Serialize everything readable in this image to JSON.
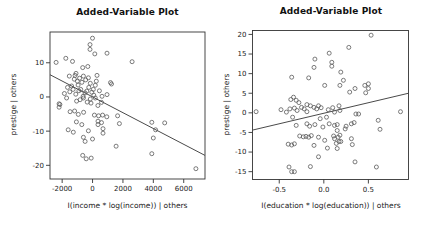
{
  "page": {
    "background": "#ffffff"
  },
  "chart_data": [
    {
      "type": "scatter",
      "title": "Added-Variable Plot",
      "xlabel": "I(income * log(income)) | others",
      "ylabel": "prestige | others",
      "xlim": [
        -2800,
        7400
      ],
      "ylim": [
        -24,
        19
      ],
      "xticks": [
        -2000,
        0,
        2000,
        4000,
        6000
      ],
      "xtick_labels": [
        "-2000",
        "0",
        "2000",
        "4000",
        "6000"
      ],
      "yticks": [
        -20,
        -10,
        0,
        10
      ],
      "ytick_labels": [
        "-20",
        "-10",
        "0",
        "10"
      ],
      "grid": false,
      "marker": "open-circle",
      "point_color": "#5a5a5a",
      "line_color": "#4a4a4a",
      "regression_line": {
        "x1": -2800,
        "y1": 6.5,
        "x2": 7400,
        "y2": -17.1
      },
      "points": [
        [
          0,
          17.2
        ],
        [
          -170,
          15.3
        ],
        [
          -170,
          13.9
        ],
        [
          150,
          12.6
        ],
        [
          950,
          12.8
        ],
        [
          2600,
          10.3
        ],
        [
          -2400,
          10.1
        ],
        [
          -1760,
          11.3
        ],
        [
          -1320,
          10.4
        ],
        [
          -650,
          8.6
        ],
        [
          -310,
          8.9
        ],
        [
          -1090,
          6.9
        ],
        [
          -1150,
          6.3
        ],
        [
          -600,
          6.1
        ],
        [
          -270,
          5.6
        ],
        [
          290,
          6.3
        ],
        [
          -1530,
          6.1
        ],
        [
          -1200,
          5.2
        ],
        [
          -850,
          5.5
        ],
        [
          -450,
          5.0
        ],
        [
          250,
          4.6
        ],
        [
          -1000,
          4.6
        ],
        [
          -700,
          4.3
        ],
        [
          -150,
          4.0
        ],
        [
          180,
          3.4
        ],
        [
          1180,
          4.2
        ],
        [
          1250,
          3.8
        ],
        [
          -950,
          3.5
        ],
        [
          -1380,
          3.2
        ],
        [
          -1650,
          2.8
        ],
        [
          -250,
          2.8
        ],
        [
          -2200,
          -2.0
        ],
        [
          -2200,
          -3.0
        ],
        [
          -2150,
          -2.2
        ],
        [
          -1850,
          1.0
        ],
        [
          -1710,
          -0.3
        ],
        [
          -1500,
          1.5
        ],
        [
          -1280,
          2.2
        ],
        [
          -1100,
          0.8
        ],
        [
          -900,
          1.8
        ],
        [
          -780,
          2.2
        ],
        [
          -620,
          0.2
        ],
        [
          -500,
          1.2
        ],
        [
          -380,
          1.7
        ],
        [
          -150,
          -0.6
        ],
        [
          -50,
          1.4
        ],
        [
          50,
          2.2
        ],
        [
          80,
          0.5
        ],
        [
          180,
          -0.3
        ],
        [
          450,
          1.8
        ],
        [
          620,
          0.2
        ],
        [
          950,
          0.7
        ],
        [
          -1050,
          -1.2
        ],
        [
          -820,
          -0.8
        ],
        [
          -600,
          -0.3
        ],
        [
          -350,
          -1.5
        ],
        [
          -100,
          -1.8
        ],
        [
          350,
          -2.5
        ],
        [
          590,
          -1.6
        ],
        [
          -1480,
          -4.3
        ],
        [
          -1180,
          -4.1
        ],
        [
          -940,
          -5.1
        ],
        [
          -590,
          -4.5
        ],
        [
          120,
          -5.3
        ],
        [
          400,
          -5.5
        ],
        [
          660,
          -5.3
        ],
        [
          940,
          -5.8
        ],
        [
          1650,
          -5.5
        ],
        [
          -1600,
          -9.6
        ],
        [
          -1270,
          -10.3
        ],
        [
          -1060,
          -7.3
        ],
        [
          -710,
          -8.1
        ],
        [
          360,
          -7.1
        ],
        [
          590,
          -7.5
        ],
        [
          360,
          -8.1
        ],
        [
          1770,
          -7.8
        ],
        [
          -270,
          -9.9
        ],
        [
          690,
          -9.3
        ],
        [
          690,
          -10.6
        ],
        [
          -600,
          -11.8
        ],
        [
          -490,
          -13.0
        ],
        [
          0,
          -12.3
        ],
        [
          -650,
          -17.1
        ],
        [
          -420,
          -18.1
        ],
        [
          -90,
          -17.9
        ],
        [
          1550,
          -14.4
        ],
        [
          3900,
          -7.4
        ],
        [
          4750,
          -7.6
        ],
        [
          4150,
          -9.6
        ],
        [
          4000,
          -12.0
        ],
        [
          3900,
          -16.6
        ],
        [
          6800,
          -21.0
        ]
      ]
    },
    {
      "type": "scatter",
      "title": "Added-Variable Plot",
      "xlabel": "I(education * log(education)) | others",
      "ylabel": "prestige | others",
      "xlim": [
        -0.8,
        0.95
      ],
      "ylim": [
        -17,
        21
      ],
      "xticks": [
        -0.5,
        0.0,
        0.5
      ],
      "xtick_labels": [
        "-0.5",
        "0.0",
        "0.5"
      ],
      "yticks": [
        -15,
        -10,
        -5,
        0,
        5,
        10,
        15,
        20
      ],
      "ytick_labels": [
        "-15",
        "-10",
        "-5",
        "0",
        "5",
        "10",
        "15",
        "20"
      ],
      "grid": false,
      "marker": "open-circle",
      "point_color": "#5a5a5a",
      "line_color": "#4a4a4a",
      "regression_line": {
        "x1": -0.8,
        "y1": -4.4,
        "x2": 0.95,
        "y2": 5.0
      },
      "points": [
        [
          -0.76,
          0.3
        ],
        [
          0.53,
          19.8
        ],
        [
          0.28,
          16.7
        ],
        [
          0.06,
          15.2
        ],
        [
          -0.1,
          13.7
        ],
        [
          -0.11,
          11.6
        ],
        [
          0.09,
          12.9
        ],
        [
          0.09,
          11.9
        ],
        [
          0.19,
          10.4
        ],
        [
          -0.36,
          9.1
        ],
        [
          -0.17,
          8.9
        ],
        [
          0.22,
          8.3
        ],
        [
          0.18,
          7.0
        ],
        [
          0.35,
          6.2
        ],
        [
          0.46,
          7.0
        ],
        [
          0.5,
          7.4
        ],
        [
          0.5,
          6.2
        ],
        [
          0.47,
          5.1
        ],
        [
          0.29,
          5.3
        ],
        [
          0.01,
          7.0
        ],
        [
          -0.34,
          4.0
        ],
        [
          -0.37,
          3.4
        ],
        [
          -0.31,
          3.2
        ],
        [
          -0.28,
          2.6
        ],
        [
          -0.19,
          2.1
        ],
        [
          -0.15,
          1.8
        ],
        [
          -0.11,
          1.4
        ],
        [
          -0.06,
          1.8
        ],
        [
          -0.03,
          1.3
        ],
        [
          0.1,
          1.3
        ],
        [
          0.17,
          1.8
        ],
        [
          -0.48,
          0.8
        ],
        [
          -0.42,
          0.2
        ],
        [
          -0.38,
          1.0
        ],
        [
          -0.33,
          1.2
        ],
        [
          -0.3,
          0.6
        ],
        [
          -0.25,
          1.4
        ],
        [
          -0.22,
          1.0
        ],
        [
          -0.19,
          0.3
        ],
        [
          -0.08,
          1.0
        ],
        [
          0.05,
          0.8
        ],
        [
          0.12,
          0.2
        ],
        [
          0.18,
          0.6
        ],
        [
          -0.35,
          -1.1
        ],
        [
          -0.04,
          -1.5
        ],
        [
          0.03,
          -1.1
        ],
        [
          0.36,
          -0.3
        ],
        [
          0.39,
          -0.3
        ],
        [
          0.61,
          -1.9
        ],
        [
          0.86,
          0.3
        ],
        [
          -0.31,
          -3.2
        ],
        [
          -0.19,
          -2.8
        ],
        [
          -0.16,
          -3.4
        ],
        [
          -0.1,
          -3.0
        ],
        [
          -0.01,
          -3.6
        ],
        [
          0.06,
          -2.8
        ],
        [
          0.12,
          -3.2
        ],
        [
          0.25,
          -3.4
        ],
        [
          0.31,
          -2.8
        ],
        [
          0.34,
          -2.5
        ],
        [
          0.24,
          -4.1
        ],
        [
          0.15,
          -3.0
        ],
        [
          0.63,
          -4.2
        ],
        [
          -0.27,
          -5.9
        ],
        [
          -0.23,
          -6.1
        ],
        [
          -0.2,
          -6.0
        ],
        [
          -0.17,
          -6.2
        ],
        [
          -0.14,
          -5.8
        ],
        [
          -0.06,
          -6.2
        ],
        [
          0.15,
          -4.5
        ],
        [
          0.18,
          -5.7
        ],
        [
          0.11,
          -5.9
        ],
        [
          -0.4,
          -8.0
        ],
        [
          -0.36,
          -8.2
        ],
        [
          -0.33,
          -7.9
        ],
        [
          -0.11,
          -8.3
        ],
        [
          0.04,
          -9.0
        ],
        [
          0.01,
          -7.0
        ],
        [
          0.17,
          -7.3
        ],
        [
          0.16,
          -6.2
        ],
        [
          0.12,
          -6.6
        ],
        [
          0.19,
          -7.3
        ],
        [
          0.14,
          -7.8
        ],
        [
          0.31,
          -6.6
        ],
        [
          0.32,
          -8.1
        ],
        [
          0.15,
          -9.1
        ],
        [
          -0.06,
          -11.2
        ],
        [
          0.35,
          -12.5
        ],
        [
          -0.39,
          -13.8
        ],
        [
          -0.36,
          -15.0
        ],
        [
          -0.33,
          -15.0
        ],
        [
          -0.15,
          -13.7
        ],
        [
          0.59,
          -13.8
        ]
      ]
    }
  ]
}
